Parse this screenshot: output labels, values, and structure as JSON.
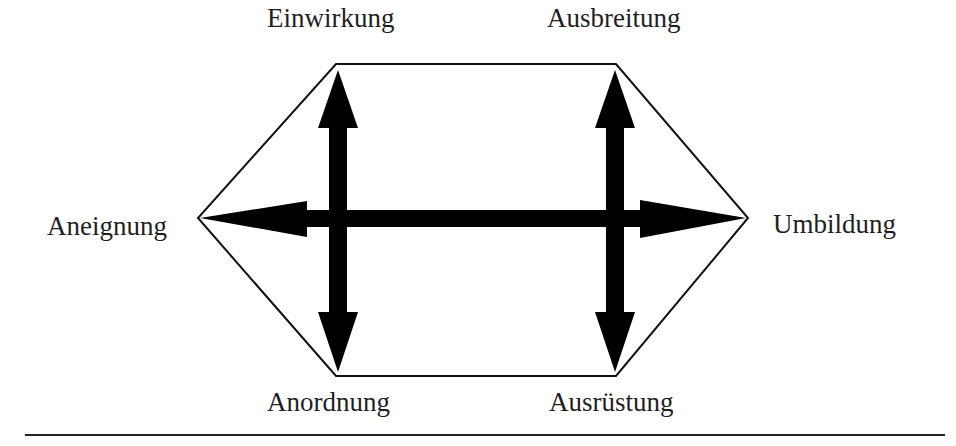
{
  "diagram": {
    "nodes": {
      "top_left": "Einwirkung",
      "top_right": "Ausbreitung",
      "left": "Aneignung",
      "right": "Umbildung",
      "bottom_left": "Anordnung",
      "bottom_right": "Ausrüstung"
    },
    "edges": [
      {
        "from": "Aneignung",
        "to": "Umbildung",
        "type": "double-arrow",
        "orientation": "horizontal"
      },
      {
        "from": "Einwirkung",
        "to": "Anordnung",
        "type": "double-arrow",
        "orientation": "vertical"
      },
      {
        "from": "Ausbreitung",
        "to": "Ausrüstung",
        "type": "double-arrow",
        "orientation": "vertical"
      }
    ],
    "shape": "hexagon",
    "colors": {
      "stroke": "#000000",
      "text": "#1f1f1f",
      "background": "#ffffff"
    }
  }
}
